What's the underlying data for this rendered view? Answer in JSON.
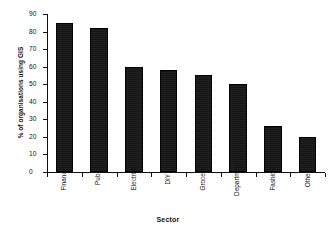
{
  "chart_data": {
    "type": "bar",
    "title": "",
    "xlabel": "Sector",
    "ylabel": "% of organisations using GIS",
    "categories": [
      "Finance",
      "Pub",
      "Electrial",
      "DIY",
      "Grocery",
      "Department",
      "Fashion",
      "Other"
    ],
    "values": [
      85,
      82,
      60,
      58,
      55,
      50,
      26,
      20
    ],
    "ylim": [
      0,
      90
    ],
    "ytick_labels": [
      "90",
      "80",
      "70",
      "60",
      "50",
      "40",
      "30",
      "20",
      "10",
      "0"
    ],
    "ytick_values": [
      90,
      80,
      70,
      60,
      50,
      40,
      30,
      20,
      10,
      0
    ],
    "grid": false,
    "legend": false,
    "bar_color": "#151515",
    "axis_color": "#111111",
    "background_color": "#ffffff"
  }
}
